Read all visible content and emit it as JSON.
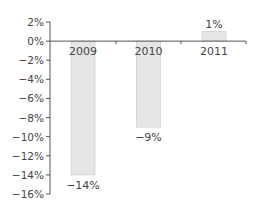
{
  "chart_data": {
    "type": "bar",
    "title": "",
    "xlabel": "",
    "ylabel": "",
    "categories": [
      "2009",
      "2010",
      "2011"
    ],
    "values": [
      -14,
      -9,
      1
    ],
    "value_labels": [
      "−14%",
      "−9%",
      "1%"
    ],
    "ylim": [
      -16,
      2
    ],
    "yticks": [
      2,
      0,
      -2,
      -4,
      -6,
      -8,
      -10,
      -12,
      -14,
      -16
    ],
    "ytick_labels": [
      "2%",
      "0%",
      "−2%",
      "−4%",
      "−6%",
      "−8%",
      "−10%",
      "−12%",
      "−14%",
      "−16%"
    ],
    "grid": false,
    "legend": null,
    "colors": {
      "bar_fill": "#e6e6e6",
      "bar_stroke": "#d2d2d2",
      "axis": "#555555",
      "text": "#444444"
    }
  }
}
